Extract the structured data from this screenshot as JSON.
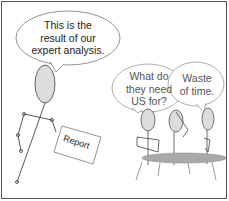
{
  "comic": {
    "speaker_bubble": {
      "lines": [
        "This is the",
        "result of our",
        "expert analysis."
      ]
    },
    "listener_bubble_1": {
      "lines": [
        "What do",
        "they need",
        "US for?"
      ]
    },
    "listener_bubble_2": {
      "lines": [
        "Waste",
        "of time."
      ]
    },
    "report_label": "Report"
  },
  "colors": {
    "head_fill": "#dcdcdc",
    "table_fill": "#a9a9a9",
    "line": "#444444",
    "border": "#555555"
  }
}
